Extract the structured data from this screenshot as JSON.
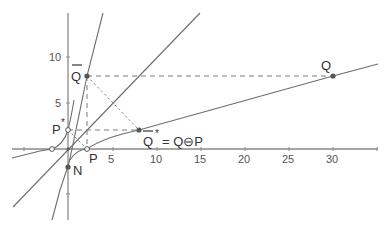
{
  "figure": {
    "x_axis": {
      "ticks": [
        "5",
        "10",
        "15",
        "20",
        "25",
        "30"
      ]
    },
    "y_axis": {
      "ticks": [
        "5",
        "10"
      ]
    },
    "points": {
      "Q_bar": {
        "label": "Q",
        "bar": true
      },
      "Q": {
        "label": "Q"
      },
      "P_star": {
        "label": "P",
        "sup": "*"
      },
      "Q_bar_star": {
        "label": "Q",
        "bar": true,
        "sup": "*",
        "equation": "= Q⊖P"
      },
      "P": {
        "label": "P"
      },
      "N": {
        "label": "N"
      }
    },
    "colors": {
      "axis": "#8a8a8a",
      "curve": "#6e6e6e",
      "point": "#555555"
    }
  }
}
